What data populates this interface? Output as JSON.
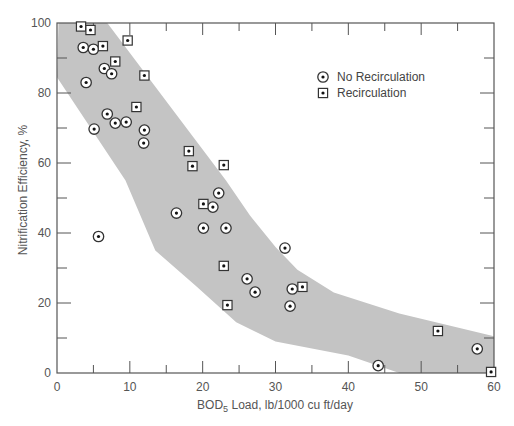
{
  "colors": {
    "band": "#c4c4c4",
    "axis": "#555555",
    "marker_stroke": "#333333",
    "marker_fill": "#ffffff",
    "marker_dot": "#111111"
  },
  "legend": {
    "items": [
      {
        "label": "No Recirculation",
        "marker": "circle-dot"
      },
      {
        "label": "Recirculation",
        "marker": "square-dot"
      }
    ]
  },
  "chart_data": {
    "type": "scatter",
    "title": "",
    "xlabel": "BOD5 Load, lb/1000 cu ft/day",
    "xlabel_main": "BOD",
    "xlabel_sub": "5",
    "xlabel_rest": " Load, lb/1000 cu ft/day",
    "ylabel": "Nitrification Efficiency, %",
    "xlim": [
      0,
      60
    ],
    "ylim": [
      0,
      100
    ],
    "xticks": [
      0,
      10,
      20,
      30,
      40,
      50,
      60
    ],
    "xminor": [
      5,
      15,
      25,
      35,
      45,
      55
    ],
    "yticks": [
      0,
      20,
      40,
      60,
      80,
      100
    ],
    "yminor": [
      10,
      30,
      50,
      70,
      90
    ],
    "grid": false,
    "legend_position": "upper right (inside)",
    "series": [
      {
        "name": "No Recirculation",
        "marker": "circle-dot",
        "points": [
          [
            3.6,
            93
          ],
          [
            5.0,
            92.5
          ],
          [
            6.5,
            87
          ],
          [
            7.5,
            85.5
          ],
          [
            4.0,
            83
          ],
          [
            6.9,
            74
          ],
          [
            8.0,
            71.4
          ],
          [
            9.5,
            71.7
          ],
          [
            5.1,
            69.7
          ],
          [
            12.0,
            69.4
          ],
          [
            11.9,
            65.7
          ],
          [
            5.7,
            39
          ],
          [
            22.2,
            51.4
          ],
          [
            21.4,
            47.4
          ],
          [
            16.4,
            45.7
          ],
          [
            20.1,
            41.4
          ],
          [
            23.2,
            41.4
          ],
          [
            31.3,
            35.7
          ],
          [
            26.1,
            26.9
          ],
          [
            27.2,
            23.1
          ],
          [
            32.3,
            24.0
          ],
          [
            32.0,
            19.1
          ],
          [
            44.1,
            2.1
          ],
          [
            57.7,
            6.9
          ]
        ]
      },
      {
        "name": "Recirculation",
        "marker": "square-dot",
        "points": [
          [
            3.3,
            99
          ],
          [
            4.6,
            98
          ],
          [
            6.3,
            93.4
          ],
          [
            9.7,
            95
          ],
          [
            8.0,
            89
          ],
          [
            12.0,
            85
          ],
          [
            10.9,
            76
          ],
          [
            18.1,
            63.4
          ],
          [
            18.6,
            59.1
          ],
          [
            22.9,
            59.4
          ],
          [
            20.1,
            48.3
          ],
          [
            22.9,
            30.6
          ],
          [
            23.4,
            19.4
          ],
          [
            33.7,
            24.6
          ],
          [
            52.3,
            12.0
          ],
          [
            59.6,
            0.3
          ]
        ]
      }
    ],
    "band": {
      "description": "Shaded envelope of data",
      "upper_edge": [
        [
          0.2,
          100
        ],
        [
          6.9,
          100
        ],
        [
          23.2,
          55
        ],
        [
          26.5,
          45
        ],
        [
          30,
          36
        ],
        [
          33.0,
          29.5
        ],
        [
          38,
          23
        ],
        [
          47,
          17
        ],
        [
          60,
          10.5
        ]
      ],
      "lower_edge": [
        [
          60,
          0
        ],
        [
          47,
          0
        ],
        [
          40,
          5
        ],
        [
          30,
          9
        ],
        [
          24.6,
          14.5
        ],
        [
          19,
          25
        ],
        [
          13.5,
          35
        ],
        [
          9.4,
          55
        ],
        [
          0,
          84.5
        ]
      ]
    }
  }
}
